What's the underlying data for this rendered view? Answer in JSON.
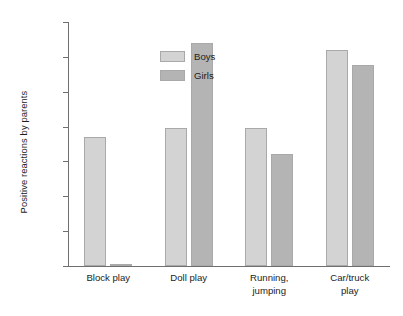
{
  "chart_data": {
    "type": "bar",
    "title": "",
    "subtitle": "",
    "xlabel": "",
    "ylabel": "Positive reactions by parents",
    "categories": [
      "Block play",
      "Doll play",
      "Running,\njumping",
      "Car/truck\nplay"
    ],
    "category_lines": [
      [
        "Block play"
      ],
      [
        "Doll play"
      ],
      [
        "Running,",
        "jumping"
      ],
      [
        "Car/truck",
        "play"
      ]
    ],
    "series": [
      {
        "name": "Boys",
        "values": [
          0.37,
          0.395,
          0.395,
          0.62
        ],
        "color": "#d3d3d3"
      },
      {
        "name": "Girls",
        "values": [
          0.005,
          0.64,
          0.32,
          0.577
        ],
        "color": "#b4b4b4"
      }
    ],
    "ylim": [
      0.0,
      0.7
    ],
    "yticks": [
      0.7,
      0.6,
      0.5,
      0.4,
      0.3,
      0.2,
      0.1,
      0.0
    ],
    "ytick_labels": [
      ".70",
      ".60",
      ".50",
      ".40",
      ".30",
      ".20",
      ".10",
      ".00"
    ],
    "grid": false,
    "legend_position": "top-left",
    "legend": [
      "Boys",
      "Girls"
    ]
  },
  "axis": {
    "y_title": "Positive reactions by parents",
    "ticks": [
      {
        "label": ".70",
        "value": 0.7
      },
      {
        "label": ".60",
        "value": 0.6
      },
      {
        "label": ".50",
        "value": 0.5
      },
      {
        "label": ".40",
        "value": 0.4
      },
      {
        "label": ".30",
        "value": 0.3
      },
      {
        "label": ".20",
        "value": 0.2
      },
      {
        "label": ".10",
        "value": 0.1
      },
      {
        "label": ".00",
        "value": 0.0
      }
    ]
  },
  "legend": {
    "items": [
      {
        "label": "Boys",
        "color": "#d3d3d3"
      },
      {
        "label": "Girls",
        "color": "#b4b4b4"
      }
    ]
  },
  "categories": [
    {
      "line1": "Block play",
      "line2": ""
    },
    {
      "line1": "Doll play",
      "line2": ""
    },
    {
      "line1": "Running,",
      "line2": "jumping"
    },
    {
      "line1": "Car/truck",
      "line2": "play"
    }
  ]
}
